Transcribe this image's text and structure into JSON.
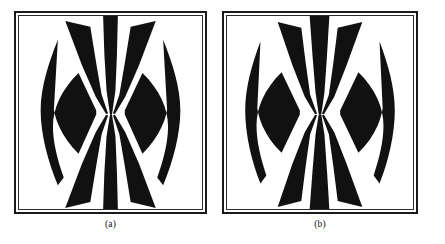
{
  "figure": {
    "background_color": "#ffffff",
    "ink_color": "#111111",
    "frame_color": "#1a1a1a",
    "panels": [
      {
        "id": "a",
        "caption": "(a)",
        "frame": {
          "x": 14,
          "y": 11,
          "width": 193,
          "height": 203
        },
        "graphic": {
          "type": "radial-wedge-pattern",
          "description": "Black fan of wedges converging to a single central point, flanked by curved crescent lobes",
          "convergence_point": {
            "x": 111,
            "y": 118
          },
          "wedge_count": 8,
          "fill_color": "#111111",
          "ground_color": "#ffffff",
          "outer_lobe_shape": "crescent",
          "symmetry": "bilateral-vertical-and-horizontal"
        }
      },
      {
        "id": "b",
        "caption": "(b)",
        "frame": {
          "x": 229,
          "y": 11,
          "width": 196,
          "height": 203
        },
        "graphic": {
          "type": "radial-wedge-pattern",
          "description": "Black fan of wedges converging to a single central point, narrower wedges with stronger S-curve lobes",
          "convergence_point": {
            "x": 325,
            "y": 118
          },
          "wedge_count": 8,
          "fill_color": "#111111",
          "ground_color": "#ffffff",
          "outer_lobe_shape": "crescent",
          "symmetry": "bilateral-vertical-and-horizontal"
        }
      }
    ]
  }
}
